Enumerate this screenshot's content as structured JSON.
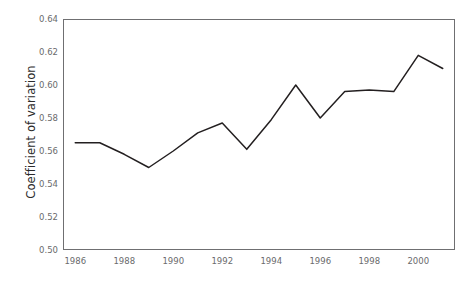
{
  "chart_data": {
    "type": "line",
    "title": "",
    "xlabel": "",
    "ylabel": "Coefficient of variation",
    "xlim": [
      1985.5,
      2001.5
    ],
    "ylim": [
      0.5,
      0.64
    ],
    "grid": false,
    "legend": "none",
    "line_color": "#231f20",
    "x": [
      1986,
      1987,
      1988,
      1989,
      1990,
      1991,
      1992,
      1993,
      1994,
      1995,
      1996,
      1997,
      1998,
      1999,
      2000,
      2001
    ],
    "values": [
      0.565,
      0.565,
      0.558,
      0.55,
      0.56,
      0.571,
      0.577,
      0.561,
      0.579,
      0.6,
      0.58,
      0.596,
      0.597,
      0.596,
      0.618,
      0.61
    ],
    "xtick_labels": [
      "1986",
      "1988",
      "1990",
      "1992",
      "1994",
      "1996",
      "1998",
      "2000"
    ],
    "xtick_values": [
      1986,
      1988,
      1990,
      1992,
      1994,
      1996,
      1998,
      2000
    ],
    "ytick_labels": [
      "0.50",
      "0.52",
      "0.54",
      "0.56",
      "0.58",
      "0.60",
      "0.62",
      "0.64"
    ],
    "ytick_values": [
      0.5,
      0.52,
      0.54,
      0.56,
      0.58,
      0.6,
      0.62,
      0.64
    ]
  }
}
